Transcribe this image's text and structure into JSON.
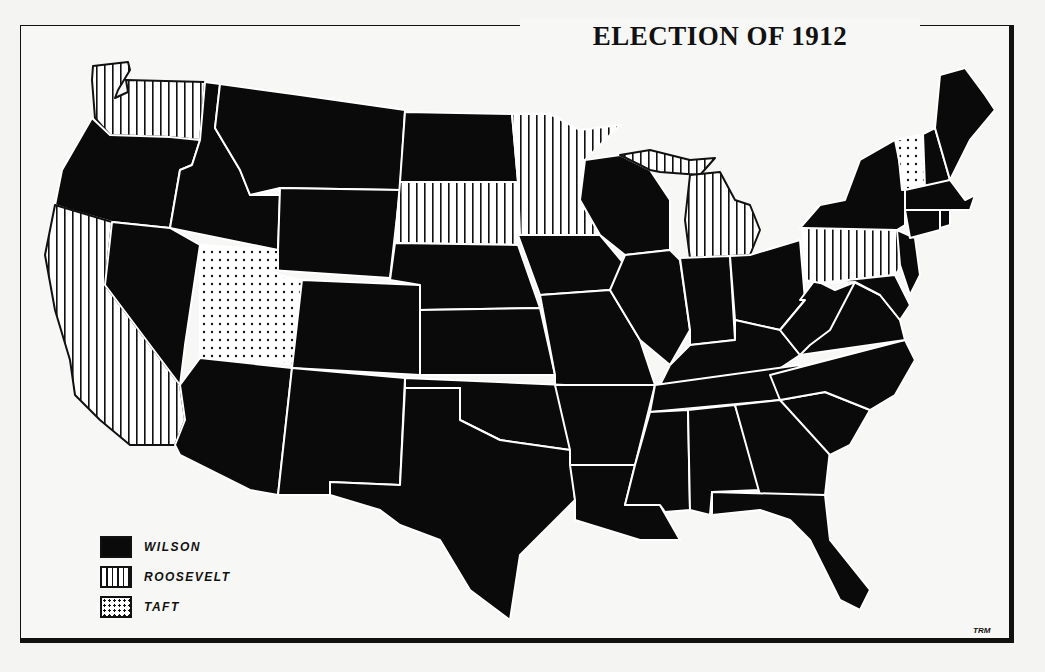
{
  "title": "ELECTION OF 1912",
  "credit": "TRM",
  "colors": {
    "wilson": "#0a0a0a",
    "roosevelt_pattern": "vertical-stripes",
    "taft_pattern": "dots",
    "border": "#ffffff",
    "frame": "#111111"
  },
  "legend": [
    {
      "candidate": "WILSON",
      "pattern": "solid-black"
    },
    {
      "candidate": "ROOSEVELT",
      "pattern": "vertical-stripes"
    },
    {
      "candidate": "TAFT",
      "pattern": "dots"
    }
  ],
  "states": {
    "wilson": [
      "Oregon",
      "Idaho",
      "Montana",
      "Wyoming",
      "Nevada",
      "Colorado",
      "Arizona",
      "New Mexico",
      "North Dakota",
      "Nebraska",
      "Kansas",
      "Oklahoma",
      "Texas",
      "Iowa",
      "Missouri",
      "Arkansas",
      "Louisiana",
      "Wisconsin",
      "Illinois",
      "Indiana",
      "Ohio",
      "Kentucky",
      "Tennessee",
      "Mississippi",
      "Alabama",
      "Georgia",
      "Florida",
      "South Carolina",
      "North Carolina",
      "Virginia",
      "West Virginia",
      "Maryland",
      "Delaware",
      "New Jersey",
      "New York",
      "Connecticut",
      "Rhode Island",
      "Massachusetts",
      "New Hampshire",
      "Maine"
    ],
    "roosevelt": [
      "Washington",
      "California",
      "South Dakota",
      "Minnesota",
      "Michigan",
      "Pennsylvania"
    ],
    "taft": [
      "Utah",
      "Vermont"
    ]
  }
}
